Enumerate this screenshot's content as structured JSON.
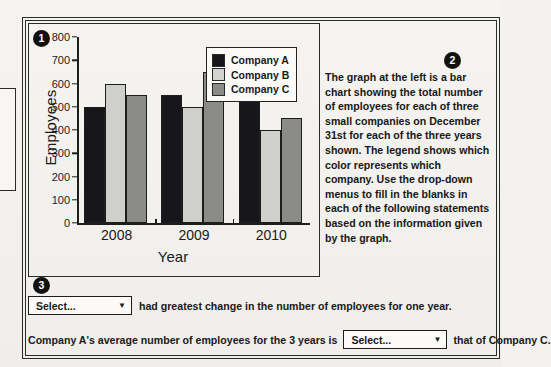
{
  "chart_data": {
    "type": "bar",
    "title": "",
    "xlabel": "Year",
    "ylabel": "Employees",
    "categories": [
      "2008",
      "2009",
      "2010"
    ],
    "series": [
      {
        "name": "Company A",
        "color": "#17161a",
        "values": [
          500,
          550,
          600
        ]
      },
      {
        "name": "Company B",
        "color": "#d3d3cf",
        "values": [
          600,
          500,
          400
        ]
      },
      {
        "name": "Company C",
        "color": "#8b8b87",
        "values": [
          550,
          650,
          450
        ]
      }
    ],
    "ylim": [
      0,
      800
    ],
    "yticks": [
      "0",
      "100",
      "200",
      "300",
      "400",
      "500",
      "600",
      "700",
      "800"
    ],
    "grid": false,
    "legend_position": "top-right"
  },
  "badges": {
    "one": "1",
    "two": "2",
    "three": "3"
  },
  "legend": {
    "items": [
      {
        "label": "Company A"
      },
      {
        "label": "Company B"
      },
      {
        "label": "Company C"
      }
    ]
  },
  "description": {
    "text": "The graph at the left is a bar chart showing the total number of employees for each of three small companies on December 31st for each of the three years shown. The legend shows which color represents which company. Use the drop-down menus to fill in the blanks in each of the following statements based on the information given by the graph."
  },
  "statements": {
    "first": {
      "dropdown_value": "Select...",
      "text_after": "had greatest change in the number of employees for one year."
    },
    "second": {
      "text_before": "Company A's average number of employees for the 3 years is",
      "dropdown_value": "Select...",
      "text_after": "that of Company C."
    }
  },
  "colors": {
    "company_a": "#17161a",
    "company_b": "#d3d3cf",
    "company_c": "#8b8b87",
    "frame": "#2b2b2b",
    "page_bg": "#f3f2ef"
  }
}
